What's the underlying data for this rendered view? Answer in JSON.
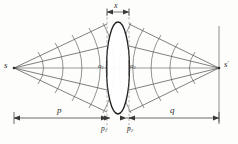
{
  "figure": {
    "type": "optics-ray-diagram",
    "background_color": "#fdfdfb",
    "ink_color": "#3a3a3a",
    "size": {
      "width": 238,
      "height": 144
    }
  },
  "labels": {
    "source": "s",
    "image": "s",
    "image_prime": "′",
    "vertex_left": "o",
    "vertex_left_sub": "1",
    "vertex_right": "o",
    "vertex_right_sub": "2",
    "object_distance": "p",
    "image_distance": "q",
    "lens_left_thickness": "p",
    "lens_left_thickness_sub": "1",
    "lens_right_thickness": "p",
    "lens_right_thickness_sub": "2",
    "lens_width": "x"
  },
  "geometry": {
    "axis_y": 68,
    "source_x": 14,
    "image_x": 219,
    "lens_center_x": 118,
    "lens_left_edge_x": 107,
    "lens_right_edge_x": 129,
    "lens_top_y": 22,
    "lens_bottom_y": 114,
    "dimension_line_y": 118,
    "ray_count_per_side": 3,
    "wavefront_count_per_side": 5
  },
  "dimensions": [
    {
      "name": "p",
      "from": "s",
      "to": "o1",
      "label": "p"
    },
    {
      "name": "q",
      "from": "o2",
      "to": "s-prime",
      "label": "q"
    },
    {
      "name": "p1",
      "at": "lens-left-edge",
      "label": "p1"
    },
    {
      "name": "p2",
      "at": "lens-right-edge",
      "label": "p2"
    },
    {
      "name": "x",
      "span": "lens-thickness",
      "label": "x"
    }
  ]
}
